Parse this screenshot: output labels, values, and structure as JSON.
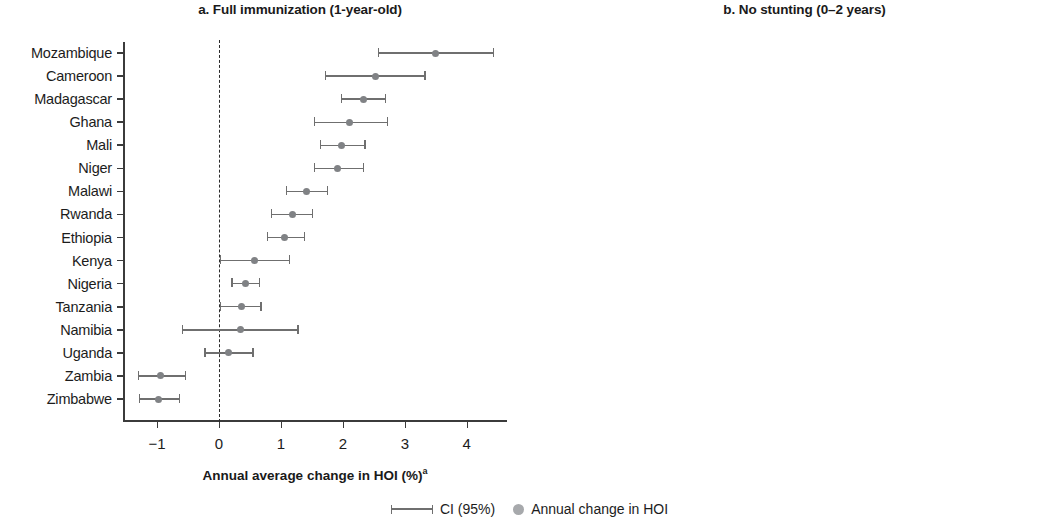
{
  "legend": {
    "ci_label": "CI (95%)",
    "point_label": "Annual change in HOI",
    "ci_icon": "error-bar-icon",
    "point_icon": "circle-marker-icon"
  },
  "axis_title": "Annual average change in HOI (%)",
  "axis_title_superscript": "a",
  "colors": {
    "marker": "#808285",
    "ci": "#6f6f6f",
    "axis": "#3b3b3b",
    "text": "#1c1c1c"
  },
  "chart_data": [
    {
      "type": "scatter",
      "panel": "a",
      "title": "a. Full immunization (1-year-old)",
      "xlabel": "Annual average change in HOI (%)",
      "ylabel": "",
      "xlim": [
        -1.55,
        4.65
      ],
      "xticks": [
        -1,
        0,
        1,
        2,
        3,
        4
      ],
      "xticklabels": [
        "−1",
        "0",
        "1",
        "2",
        "3",
        "4"
      ],
      "grid": false,
      "reference_line": 0,
      "categories": [
        "Mozambique",
        "Cameroon",
        "Madagascar",
        "Ghana",
        "Mali",
        "Niger",
        "Malawi",
        "Rwanda",
        "Ethiopia",
        "Kenya",
        "Nigeria",
        "Tanzania",
        "Namibia",
        "Uganda",
        "Zambia",
        "Zimbabwe"
      ],
      "values": [
        3.5,
        2.53,
        2.34,
        2.11,
        1.98,
        1.92,
        1.42,
        1.18,
        1.06,
        0.58,
        0.42,
        0.36,
        0.34,
        0.16,
        -0.94,
        -0.97
      ],
      "ci_lower": [
        2.56,
        1.71,
        1.97,
        1.53,
        1.63,
        1.53,
        1.08,
        0.84,
        0.77,
        0.01,
        0.2,
        0.01,
        -0.6,
        -0.24,
        -1.31,
        -1.29
      ],
      "ci_upper": [
        4.44,
        3.34,
        2.7,
        2.73,
        2.37,
        2.34,
        1.76,
        1.52,
        1.39,
        1.15,
        0.67,
        0.69,
        1.29,
        0.56,
        -0.53,
        -0.63
      ]
    },
    {
      "type": "scatter",
      "panel": "b",
      "title": "b. No stunting (0–2 years)",
      "xlabel": "Annual average change in HOI (%)",
      "ylabel": "",
      "xlim": [
        -1.8,
        3.05
      ],
      "xticks": [
        -1,
        0,
        1,
        2,
        3
      ],
      "xticklabels": [
        "−1",
        "0",
        "1",
        "2",
        "3"
      ],
      "grid": false,
      "reference_line": 0,
      "categories": [
        "Nigeria",
        "Ethiopia",
        "Madagascar",
        "Uganda",
        "Malawi",
        "Zambia",
        "Tanzania",
        "Mozambique",
        "Kenya",
        "Ghana",
        "Mali",
        "Cameroon",
        "Rwanda",
        "Zimbabwe",
        "Niger",
        "Namibia"
      ],
      "values": [
        2.63,
        1.4,
        1.03,
        0.77,
        0.48,
        0.45,
        0.45,
        0.37,
        0.23,
        0.23,
        0.06,
        0.04,
        -0.05,
        -0.06,
        -0.52,
        -0.88
      ],
      "ci_lower": [
        2.4,
        1.16,
        0.78,
        0.46,
        0.2,
        0.21,
        0.25,
        -0.32,
        -0.07,
        -0.12,
        -0.13,
        -0.53,
        -0.33,
        -0.22,
        -0.91,
        -1.44
      ],
      "ci_upper": [
        2.83,
        1.67,
        1.3,
        1.1,
        0.79,
        0.7,
        0.66,
        1.06,
        0.54,
        0.58,
        0.31,
        0.63,
        0.25,
        0.16,
        -0.13,
        -0.3
      ]
    }
  ]
}
